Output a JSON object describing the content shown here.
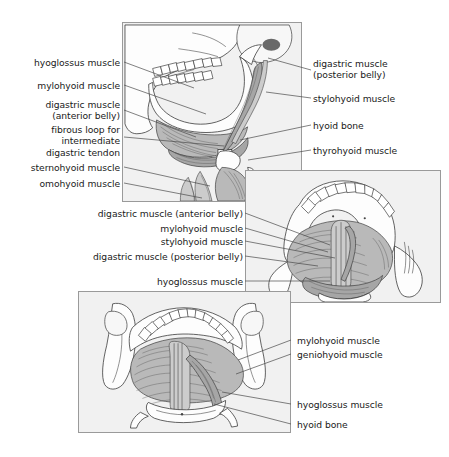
{
  "figure": {
    "width": 449,
    "height": 457,
    "background_color": "#ffffff",
    "panel_fill_color": "#f1f1f1",
    "panel_border_color": "#9a9a9a",
    "text_color": "#1a1a1a",
    "leader_line_color": "#4a4a4a"
  },
  "panels": [
    {
      "name": "lateral-view",
      "view": "lateral view of skull, mandible and neck"
    },
    {
      "name": "superior-oblique-view",
      "view": "superior oblique view of mandible and floor of mouth"
    },
    {
      "name": "posterior-view",
      "view": "posterior view of mandible, floor of mouth and hyoid bone"
    }
  ],
  "labels": {
    "lateral_left": [
      {
        "text": "hyoglossus muscle"
      },
      {
        "text": "mylohyoid muscle"
      },
      {
        "text": "digastric muscle\n(anterior belly)"
      },
      {
        "text": "fibrous loop for\nintermediate\ndigastric tendon"
      },
      {
        "text": "sternohyoid muscle"
      },
      {
        "text": "omohyoid muscle"
      }
    ],
    "lateral_right": [
      {
        "text": "digastric muscle\n(posterior belly)"
      },
      {
        "text": "stylohyoid muscle"
      },
      {
        "text": "hyoid bone"
      },
      {
        "text": "thyrohyoid muscle"
      }
    ],
    "superior_left": [
      {
        "text": "digastric muscle (anterior belly)"
      },
      {
        "text": "mylohyoid muscle"
      },
      {
        "text": "stylohyoid muscle"
      },
      {
        "text": "digastric muscle (posterior belly)"
      },
      {
        "text": "hyoglossus muscle"
      }
    ],
    "posterior_right": [
      {
        "text": "mylohyoid muscle"
      },
      {
        "text": "geniohyoid muscle"
      },
      {
        "text": "hyoglossus muscle"
      },
      {
        "text": "hyoid bone"
      }
    ]
  }
}
